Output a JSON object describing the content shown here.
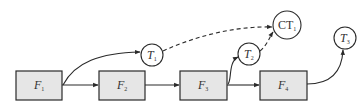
{
  "diagram": {
    "colors": {
      "box_fill": "#e6e6e6",
      "stroke": "#2a2a2a",
      "text": "#333333"
    },
    "boxes": [
      {
        "id": "F1",
        "base": "F",
        "sub": "1"
      },
      {
        "id": "F2",
        "base": "F",
        "sub": "2"
      },
      {
        "id": "F3",
        "base": "F",
        "sub": "3"
      },
      {
        "id": "F4",
        "base": "F",
        "sub": "4"
      }
    ],
    "circles": [
      {
        "id": "T1",
        "base": "T",
        "sub": "1"
      },
      {
        "id": "T2",
        "base": "T",
        "sub": "2"
      },
      {
        "id": "CT1",
        "base": "CT",
        "sub": "1"
      },
      {
        "id": "T3",
        "base": "T",
        "sub": "3"
      }
    ],
    "edges": [
      {
        "from": "F1",
        "to": "F2",
        "style": "solid"
      },
      {
        "from": "F2",
        "to": "F3",
        "style": "solid"
      },
      {
        "from": "F3",
        "to": "F4",
        "style": "solid"
      },
      {
        "from": "F1",
        "to": "T1",
        "style": "solid"
      },
      {
        "from": "F3",
        "to": "T2",
        "style": "solid"
      },
      {
        "from": "F4",
        "to": "T3",
        "style": "solid"
      },
      {
        "from": "T1",
        "to": "CT1",
        "style": "dashed"
      },
      {
        "from": "T2",
        "to": "CT1",
        "style": "dashed"
      }
    ]
  }
}
